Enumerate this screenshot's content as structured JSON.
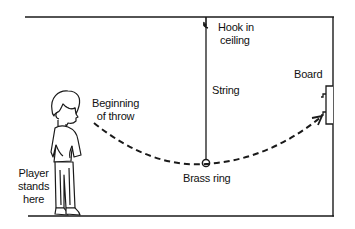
{
  "diagram": {
    "type": "physical-setup",
    "labels": {
      "hook": [
        "Hook in",
        "ceiling"
      ],
      "string": "String",
      "board": "Board",
      "beginning": [
        "Beginning",
        "of throw"
      ],
      "ring": "Brass ring",
      "player": [
        "Player",
        "stands",
        "here"
      ]
    },
    "elements": {
      "ceiling": {
        "x1": 25,
        "x2": 333,
        "y": 17
      },
      "right_wall": {
        "x": 333,
        "y1": 17,
        "y2": 216
      },
      "floor": {
        "x1": 28,
        "x2": 333,
        "y": 216
      },
      "string": {
        "x": 206,
        "y1": 17,
        "y2": 159
      },
      "ring": {
        "cx": 206,
        "cy": 163,
        "r": 3.5
      },
      "board": {
        "x": 325,
        "y1": 86,
        "y2": 124
      },
      "throw_path": {
        "start": [
          95,
          123
        ],
        "lowest": [
          206,
          164
        ],
        "end": [
          323,
          115
        ],
        "style": "dashed",
        "arrow_at_end": true
      }
    },
    "colors": {
      "line": "#1a1a1a",
      "background": "#ffffff"
    }
  }
}
